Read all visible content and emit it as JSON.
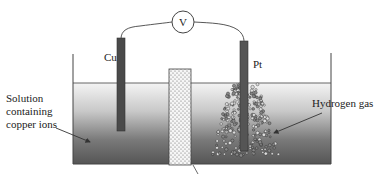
{
  "diagram": {
    "type": "electrochemical cell",
    "voltmeter": {
      "symbol": "V"
    },
    "electrodes": [
      {
        "id": "left",
        "label": "Cu"
      },
      {
        "id": "right",
        "label": "Pt"
      }
    ],
    "annotations": {
      "solution_line1": "Solution",
      "solution_line2": "containing",
      "solution_line3": "copper ions",
      "gas": "Hydrogen gas"
    },
    "colors": {
      "electrode": "#555555",
      "solution_top": "#f2f2f2",
      "solution_bottom": "#5a5a5a",
      "barrier": "#f4f4f4",
      "line": "#333333"
    }
  }
}
